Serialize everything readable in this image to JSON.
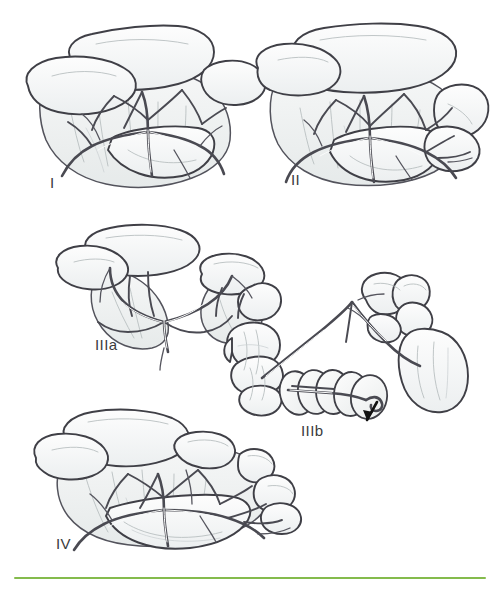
{
  "figure": {
    "background_color": "#ffffff",
    "line_color": "#4a4a52",
    "fill_color": "#f0f2f2",
    "shade_color": "#e4e7e8",
    "label_color": "#3b3b3d",
    "accent_color": "#84bb4c",
    "width": 500,
    "height": 589
  },
  "panels": [
    {
      "id": "panel-1",
      "label": "I",
      "label_x": 50,
      "label_y": 175,
      "description": "Normal mesentery with broad fan-shaped vascular arcade and overlying transverse colon"
    },
    {
      "id": "panel-2",
      "label": "II",
      "label_x": 291,
      "label_y": 172,
      "description": "Mesentery with an additional right-sided lobe and narrowed vascular pedicle"
    },
    {
      "id": "panel-3a",
      "label": "IIIa",
      "label_x": 95,
      "label_y": 337,
      "description": "Two separated bowel lobes joined by a narrow common mesenteric stalk"
    },
    {
      "id": "panel-3b",
      "label": "IIIb",
      "label_x": 301,
      "label_y": 423,
      "description": "Midgut volvulus: bowel coiled in a spiral around the narrow vascular pedicle, arrow indicating the twist"
    },
    {
      "id": "panel-4",
      "label": "IV",
      "label_x": 56,
      "label_y": 536,
      "description": "Complex mesentery with multiple lobes and an elongated arcade along the base"
    }
  ],
  "annotations": [
    {
      "id": "volvulus-arrow",
      "name": "arrow",
      "panel": "panel-3b",
      "color": "#111111"
    }
  ],
  "footer_rule": {
    "color": "#84bb4c",
    "thickness": 2
  }
}
